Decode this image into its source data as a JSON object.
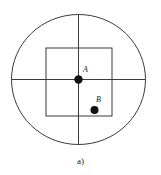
{
  "figure": {
    "caption": "a)",
    "background_color": "#ffffff",
    "stroke_color": "#3a3a3a",
    "point_color": "#111111",
    "label_color": "#1a1a1a",
    "canvas": {
      "width": 161,
      "height": 175
    },
    "shapes": {
      "outer_circle": {
        "name": "outer-circle",
        "center_x": 78.5,
        "center_y": 79.5,
        "radius_x": 67,
        "radius_y": 65,
        "stroke_width": 1
      },
      "inner_square": {
        "name": "inner-square",
        "x": 46,
        "y": 48,
        "width": 66,
        "height": 68,
        "stroke_width": 1
      },
      "horizontal_axis": {
        "name": "horizontal-axis",
        "x1": 11.5,
        "y1": 79.5,
        "x2": 145.5,
        "y2": 79.5,
        "stroke_width": 1
      },
      "vertical_axis": {
        "name": "vertical-axis",
        "x1": 78.5,
        "y1": 14.5,
        "x2": 78.5,
        "y2": 144.5,
        "stroke_width": 1
      }
    },
    "points": [
      {
        "id": "A",
        "label": "A",
        "x": 78.5,
        "y": 79.5,
        "radius": 4.2
      },
      {
        "id": "B",
        "label": "B",
        "x": 94.5,
        "y": 110,
        "radius": 4.0
      }
    ]
  }
}
